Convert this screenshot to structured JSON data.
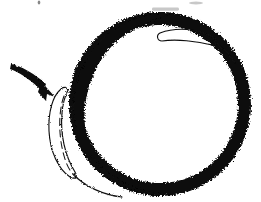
{
  "figure": {
    "medium": "scanned black ink sketch",
    "background_color": "#ffffff",
    "ink_color": "#0a0a0a",
    "canvas": {
      "width": 261,
      "height": 202
    },
    "caption": "",
    "elements": {
      "ring": {
        "name": "thick hand-drawn ring",
        "shape": "annulus",
        "center_x": 160,
        "center_y": 104,
        "radius_x": 91,
        "radius_y": 91,
        "stroke_width_px": 13,
        "edge_texture": "rough jagged brush",
        "bounds": {
          "left": 68,
          "top": 13,
          "right": 252,
          "bottom": 196
        }
      },
      "arrow": {
        "name": "annotation arrow",
        "direction": "down-right",
        "tail_x": 11,
        "tail_y": 64,
        "tip_x": 55,
        "tip_y": 96,
        "label": ""
      },
      "left_crescent": {
        "name": "outlined crescent sliver on outer left",
        "outline_only": true,
        "has_inner_dashed_line": true,
        "bounds": {
          "left": 47,
          "top": 86,
          "right": 80,
          "bottom": 175
        }
      },
      "upper_right_sliver": {
        "name": "outlined sliver inside upper right of ring",
        "outline_only": true,
        "bounds": {
          "left": 158,
          "top": 26,
          "right": 218,
          "bottom": 46
        }
      },
      "scan_artifacts": {
        "name": "faint scanner smudges",
        "count": 3
      }
    }
  }
}
